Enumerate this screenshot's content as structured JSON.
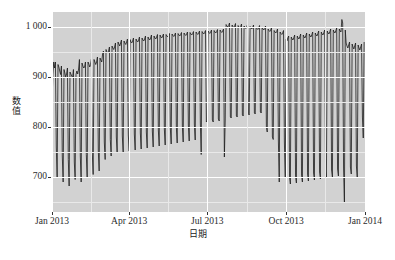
{
  "chart_data": {
    "type": "line",
    "title": "",
    "subtitle": "",
    "xlabel": "日期",
    "ylabel": "数值",
    "grid": true,
    "legend": false,
    "legend_position": "none",
    "x_type": "date",
    "x_range": [
      "2013-01-01",
      "2014-01-01"
    ],
    "xlim_label": [
      "Jan 2013",
      "Jan 2014"
    ],
    "ylim": [
      630,
      1030
    ],
    "y_axis": {
      "ticks": [
        700,
        800,
        900,
        1000
      ],
      "tick_labels": [
        "700",
        "800",
        "900",
        "1 000"
      ],
      "minor_ticks": [
        650,
        750,
        850,
        950
      ]
    },
    "x_axis": {
      "ticks": [
        "2013-01-01",
        "2013-04-01",
        "2013-07-01",
        "2013-10-01",
        "2014-01-01"
      ],
      "tick_labels": [
        "Jan 2013",
        "Apr 2013",
        "Jul 2013",
        "Oct 2013",
        "Jan 2014"
      ],
      "minor_ticks": [
        "2013-02-15",
        "2013-05-16",
        "2013-08-16",
        "2013-11-15"
      ]
    },
    "series_name": "数值",
    "line_color": "#1a1a1a",
    "panel_color": "#d2d2d2",
    "gridline_color": "#ffffff",
    "x": [
      "2013-01-01",
      "2013-01-02",
      "2013-01-03",
      "2013-01-04",
      "2013-01-05",
      "2013-01-06",
      "2013-01-07",
      "2013-01-08",
      "2013-01-09",
      "2013-01-10",
      "2013-01-11",
      "2013-01-12",
      "2013-01-13",
      "2013-01-14",
      "2013-01-15",
      "2013-01-16",
      "2013-01-17",
      "2013-01-18",
      "2013-01-19",
      "2013-01-20",
      "2013-01-21",
      "2013-01-22",
      "2013-01-23",
      "2013-01-24",
      "2013-01-25",
      "2013-01-26",
      "2013-01-27",
      "2013-01-28",
      "2013-01-29",
      "2013-01-30",
      "2013-01-31",
      "2013-02-01",
      "2013-02-02",
      "2013-02-03",
      "2013-02-04",
      "2013-02-05",
      "2013-02-06",
      "2013-02-07",
      "2013-02-08",
      "2013-02-09",
      "2013-02-10",
      "2013-02-11",
      "2013-02-12",
      "2013-02-13",
      "2013-02-14",
      "2013-02-15",
      "2013-02-16",
      "2013-02-17",
      "2013-02-18",
      "2013-02-19",
      "2013-02-20",
      "2013-02-21",
      "2013-02-22",
      "2013-02-23",
      "2013-02-24",
      "2013-02-25",
      "2013-02-26",
      "2013-02-27",
      "2013-02-28",
      "2013-03-01",
      "2013-03-02",
      "2013-03-03",
      "2013-03-04",
      "2013-03-05",
      "2013-03-06",
      "2013-03-07",
      "2013-03-08",
      "2013-03-09",
      "2013-03-10",
      "2013-03-11",
      "2013-03-12",
      "2013-03-13",
      "2013-03-14",
      "2013-03-15",
      "2013-03-16",
      "2013-03-17",
      "2013-03-18",
      "2013-03-19",
      "2013-03-20",
      "2013-03-21",
      "2013-03-22",
      "2013-03-23",
      "2013-03-24",
      "2013-03-25",
      "2013-03-26",
      "2013-03-27",
      "2013-03-28",
      "2013-03-29",
      "2013-03-30",
      "2013-03-31",
      "2013-04-01",
      "2013-04-02",
      "2013-04-03",
      "2013-04-04",
      "2013-04-05",
      "2013-04-06",
      "2013-04-07",
      "2013-04-08",
      "2013-04-09",
      "2013-04-10",
      "2013-04-11",
      "2013-04-12",
      "2013-04-13",
      "2013-04-14",
      "2013-04-15",
      "2013-04-16",
      "2013-04-17",
      "2013-04-18",
      "2013-04-19",
      "2013-04-20",
      "2013-04-21",
      "2013-04-22",
      "2013-04-23",
      "2013-04-24",
      "2013-04-25",
      "2013-04-26",
      "2013-04-27",
      "2013-04-28",
      "2013-04-29",
      "2013-04-30",
      "2013-05-01",
      "2013-05-02",
      "2013-05-03",
      "2013-05-04",
      "2013-05-05",
      "2013-05-06",
      "2013-05-07",
      "2013-05-08",
      "2013-05-09",
      "2013-05-10",
      "2013-05-11",
      "2013-05-12",
      "2013-05-13",
      "2013-05-14",
      "2013-05-15",
      "2013-05-16",
      "2013-05-17",
      "2013-05-18",
      "2013-05-19",
      "2013-05-20",
      "2013-05-21",
      "2013-05-22",
      "2013-05-23",
      "2013-05-24",
      "2013-05-25",
      "2013-05-26",
      "2013-05-27",
      "2013-05-28",
      "2013-05-29",
      "2013-05-30",
      "2013-05-31",
      "2013-06-01",
      "2013-06-02",
      "2013-06-03",
      "2013-06-04",
      "2013-06-05",
      "2013-06-06",
      "2013-06-07",
      "2013-06-08",
      "2013-06-09",
      "2013-06-10",
      "2013-06-11",
      "2013-06-12",
      "2013-06-13",
      "2013-06-14",
      "2013-06-15",
      "2013-06-16",
      "2013-06-17",
      "2013-06-18",
      "2013-06-19",
      "2013-06-20",
      "2013-06-21",
      "2013-06-22",
      "2013-06-23",
      "2013-06-24",
      "2013-06-25",
      "2013-06-26",
      "2013-06-27",
      "2013-06-28",
      "2013-06-29",
      "2013-06-30",
      "2013-07-01",
      "2013-07-02",
      "2013-07-03",
      "2013-07-04",
      "2013-07-05",
      "2013-07-06",
      "2013-07-07",
      "2013-07-08",
      "2013-07-09",
      "2013-07-10",
      "2013-07-11",
      "2013-07-12",
      "2013-07-13",
      "2013-07-14",
      "2013-07-15",
      "2013-07-16",
      "2013-07-17",
      "2013-07-18",
      "2013-07-19",
      "2013-07-20",
      "2013-07-21",
      "2013-07-22",
      "2013-07-23",
      "2013-07-24",
      "2013-07-25",
      "2013-07-26",
      "2013-07-27",
      "2013-07-28",
      "2013-07-29",
      "2013-07-30",
      "2013-07-31",
      "2013-08-01",
      "2013-08-02",
      "2013-08-03",
      "2013-08-04",
      "2013-08-05",
      "2013-08-06",
      "2013-08-07",
      "2013-08-08",
      "2013-08-09",
      "2013-08-10",
      "2013-08-11",
      "2013-08-12",
      "2013-08-13",
      "2013-08-14",
      "2013-08-15",
      "2013-08-16",
      "2013-08-17",
      "2013-08-18",
      "2013-08-19",
      "2013-08-20",
      "2013-08-21",
      "2013-08-22",
      "2013-08-23",
      "2013-08-24",
      "2013-08-25",
      "2013-08-26",
      "2013-08-27",
      "2013-08-28",
      "2013-08-29",
      "2013-08-30",
      "2013-08-31",
      "2013-09-01",
      "2013-09-02",
      "2013-09-03",
      "2013-09-04",
      "2013-09-05",
      "2013-09-06",
      "2013-09-07",
      "2013-09-08",
      "2013-09-09",
      "2013-09-10",
      "2013-09-11",
      "2013-09-12",
      "2013-09-13",
      "2013-09-14",
      "2013-09-15",
      "2013-09-16",
      "2013-09-17",
      "2013-09-18",
      "2013-09-19",
      "2013-09-20",
      "2013-09-21",
      "2013-09-22",
      "2013-09-23",
      "2013-09-24",
      "2013-09-25",
      "2013-09-26",
      "2013-09-27",
      "2013-09-28",
      "2013-09-29",
      "2013-09-30",
      "2013-10-01",
      "2013-10-02",
      "2013-10-03",
      "2013-10-04",
      "2013-10-05",
      "2013-10-06",
      "2013-10-07",
      "2013-10-08",
      "2013-10-09",
      "2013-10-10",
      "2013-10-11",
      "2013-10-12",
      "2013-10-13",
      "2013-10-14",
      "2013-10-15",
      "2013-10-16",
      "2013-10-17",
      "2013-10-18",
      "2013-10-19",
      "2013-10-20",
      "2013-10-21",
      "2013-10-22",
      "2013-10-23",
      "2013-10-24",
      "2013-10-25",
      "2013-10-26",
      "2013-10-27",
      "2013-10-28",
      "2013-10-29",
      "2013-10-30",
      "2013-10-31",
      "2013-11-01",
      "2013-11-02",
      "2013-11-03",
      "2013-11-04",
      "2013-11-05",
      "2013-11-06",
      "2013-11-07",
      "2013-11-08",
      "2013-11-09",
      "2013-11-10",
      "2013-11-11",
      "2013-11-12",
      "2013-11-13",
      "2013-11-14",
      "2013-11-15",
      "2013-11-16",
      "2013-11-17",
      "2013-11-18",
      "2013-11-19",
      "2013-11-20",
      "2013-11-21",
      "2013-11-22",
      "2013-11-23",
      "2013-11-24",
      "2013-11-25",
      "2013-11-26",
      "2013-11-27",
      "2013-11-28",
      "2013-11-29",
      "2013-11-30",
      "2013-12-01",
      "2013-12-02",
      "2013-12-03",
      "2013-12-04",
      "2013-12-05",
      "2013-12-06",
      "2013-12-07",
      "2013-12-08",
      "2013-12-09",
      "2013-12-10",
      "2013-12-11",
      "2013-12-12",
      "2013-12-13",
      "2013-12-14",
      "2013-12-15",
      "2013-12-16",
      "2013-12-17",
      "2013-12-18",
      "2013-12-19",
      "2013-12-20",
      "2013-12-21",
      "2013-12-22",
      "2013-12-23",
      "2013-12-24",
      "2013-12-25",
      "2013-12-26",
      "2013-12-27",
      "2013-12-28",
      "2013-12-29",
      "2013-12-30",
      "2013-12-31"
    ],
    "values": [
      845,
      905,
      930,
      918,
      930,
      760,
      700,
      925,
      920,
      912,
      905,
      922,
      742,
      690,
      915,
      908,
      900,
      906,
      918,
      735,
      682,
      910,
      906,
      902,
      898,
      915,
      730,
      695,
      905,
      912,
      906,
      916,
      935,
      742,
      690,
      928,
      922,
      918,
      920,
      930,
      745,
      700,
      930,
      926,
      920,
      925,
      936,
      748,
      705,
      935,
      930,
      925,
      930,
      940,
      752,
      712,
      938,
      934,
      930,
      946,
      952,
      770,
      735,
      955,
      950,
      948,
      952,
      960,
      775,
      742,
      962,
      958,
      955,
      960,
      968,
      780,
      748,
      970,
      966,
      962,
      968,
      974,
      782,
      750,
      972,
      968,
      965,
      970,
      976,
      784,
      752,
      975,
      970,
      968,
      972,
      978,
      786,
      754,
      976,
      972,
      970,
      974,
      980,
      788,
      756,
      978,
      974,
      972,
      976,
      982,
      790,
      758,
      980,
      976,
      974,
      978,
      984,
      792,
      760,
      982,
      978,
      976,
      980,
      985,
      794,
      762,
      984,
      980,
      978,
      982,
      986,
      796,
      764,
      985,
      982,
      980,
      983,
      987,
      798,
      766,
      986,
      983,
      981,
      984,
      988,
      800,
      768,
      987,
      984,
      982,
      985,
      989,
      802,
      770,
      988,
      985,
      983,
      986,
      990,
      804,
      772,
      989,
      986,
      984,
      987,
      991,
      806,
      774,
      990,
      987,
      985,
      988,
      992,
      808,
      745,
      991,
      988,
      986,
      989,
      993,
      810,
      812,
      992,
      989,
      987,
      990,
      994,
      814,
      810,
      993,
      990,
      988,
      991,
      995,
      816,
      812,
      994,
      991,
      989,
      992,
      996,
      740,
      814,
      1005,
      1002,
      1000,
      1003,
      1008,
      820,
      818,
      1004,
      1001,
      999,
      1002,
      1007,
      822,
      820,
      1003,
      1000,
      998,
      1001,
      1006,
      824,
      822,
      1002,
      999,
      997,
      1000,
      1005,
      826,
      824,
      1001,
      998,
      996,
      999,
      1004,
      828,
      826,
      1000,
      997,
      995,
      998,
      1003,
      830,
      828,
      999,
      996,
      994,
      997,
      1002,
      800,
      790,
      996,
      993,
      991,
      994,
      999,
      780,
      775,
      993,
      990,
      988,
      991,
      996,
      772,
      690,
      990,
      987,
      985,
      988,
      993,
      770,
      700,
      975,
      972,
      978,
      982,
      700,
      686,
      980,
      976,
      974,
      979,
      984,
      702,
      688,
      982,
      978,
      976,
      981,
      986,
      704,
      690,
      984,
      980,
      978,
      983,
      988,
      706,
      692,
      986,
      982,
      980,
      985,
      990,
      708,
      694,
      988,
      984,
      982,
      987,
      992,
      710,
      696,
      990,
      986,
      984,
      989,
      994,
      712,
      698,
      992,
      988,
      986,
      991,
      996,
      714,
      700,
      994,
      990,
      988,
      993,
      998,
      716,
      702,
      996,
      992,
      990,
      1015,
      1008,
      718,
      648,
      994,
      968,
      962,
      958,
      964,
      970,
      720,
      706,
      966,
      960,
      956,
      962,
      968,
      722,
      698,
      964,
      958,
      954,
      960,
      966,
      820,
      778,
      970
    ]
  }
}
